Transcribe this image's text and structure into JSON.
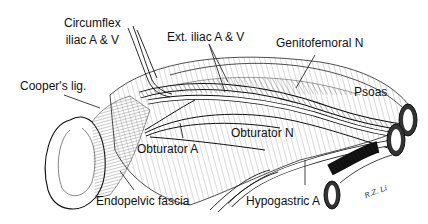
{
  "figure": {
    "type": "anatomical illustration",
    "signature": "R.Z. Li"
  },
  "labels": {
    "circumflex_line1": "Circumflex",
    "circumflex_line2": "iliac A & V",
    "ext_iliac": "Ext. iliac A & V",
    "genitofemoral": "Genitofemoral N",
    "coopers": "Cooper's lig.",
    "psoas": "Psoas",
    "obturator_n": "Obturator N",
    "obturator_a": "Obturator A",
    "endopelvic": "Endopelvic fascia",
    "hypogastric": "Hypogastric A"
  },
  "colors": {
    "ink": "#111111",
    "background": "#ffffff"
  }
}
